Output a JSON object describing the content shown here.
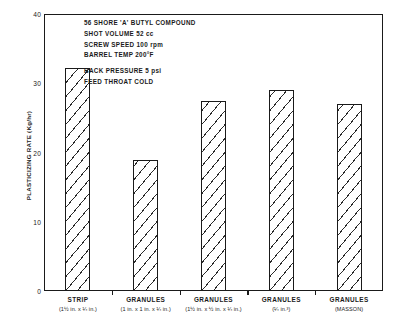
{
  "chart_data": {
    "type": "bar",
    "title": "",
    "xlabel": "",
    "ylabel": "PLASTICIZING RATE (Kg/hr)",
    "ylim": [
      0,
      40
    ],
    "yticks": [
      0,
      10,
      20,
      30,
      40
    ],
    "grid": false,
    "legend": "none",
    "categories": [
      "STRIP",
      "GRANULES",
      "GRANULES",
      "GRANULES",
      "GRANULES"
    ],
    "category_sublabels": [
      "(1½ in. x ¼ in.)",
      "(1 in. x 1 in. x ¼ in.)",
      "(1½ in. x ½ in. x ¼ in.)",
      "(¼ in.³)",
      "(MASSON)"
    ],
    "values": [
      32.2,
      18.9,
      27.4,
      29.0,
      27.0
    ],
    "annotations": [
      "56 SHORE 'A' BUTYL COMPOUND",
      "SHOT VOLUME 52 cc",
      "SCREW SPEED 100 rpm",
      "BARREL TEMP  200°F",
      "",
      "BACK PRESSURE 5 psi",
      "FEED THROAT COLD"
    ]
  },
  "style": {
    "axis_color": "#1a1a1a",
    "bar_fill": "#ffffff",
    "bar_hatch": "#2a2a2a",
    "background": "#ffffff"
  }
}
